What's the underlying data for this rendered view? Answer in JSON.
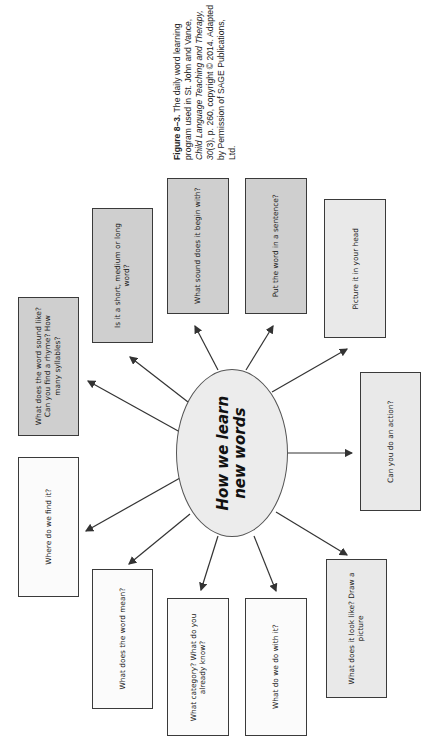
{
  "caption": {
    "figure_label": "Figure 8–3.",
    "text_1": " The daily word learning program used in St. John and Vance, ",
    "journal": "Child Language Teaching and Therapy, 30",
    "text_2": "(3), p. 260, copyright © 2014. Adapted by Permission of SAGE Publications, Ltd."
  },
  "center": {
    "line1": "How we learn",
    "line2": "new words"
  },
  "boxes": [
    {
      "id": "sound-like",
      "text": "What does the word sound like? Can you find a rhyme? How many syllables?",
      "fill": "dark",
      "x": 18,
      "y": 297,
      "w": 61,
      "h": 139
    },
    {
      "id": "word-length",
      "text": "Is it a short, medium or long word?",
      "fill": "dark",
      "x": 92,
      "y": 208,
      "w": 61,
      "h": 135
    },
    {
      "id": "begin-sound",
      "text": "What sound does it begin with?",
      "fill": "dark",
      "x": 167,
      "y": 178,
      "w": 62,
      "h": 136
    },
    {
      "id": "in-sentence",
      "text": "Put the word in a sentence?",
      "fill": "dark",
      "x": 245,
      "y": 178,
      "w": 62,
      "h": 136
    },
    {
      "id": "picture-it",
      "text": "Picture it in your head",
      "fill": "light",
      "x": 324,
      "y": 199,
      "w": 62,
      "h": 139
    },
    {
      "id": "action",
      "text": "Can you do an action?",
      "fill": "light",
      "x": 360,
      "y": 372,
      "w": 61,
      "h": 139
    },
    {
      "id": "look-like",
      "text": "What does it look like? Draw a picture",
      "fill": "light",
      "x": 326,
      "y": 559,
      "w": 61,
      "h": 139
    },
    {
      "id": "do-with-it",
      "text": "What do we do with it?",
      "fill": "white",
      "x": 245,
      "y": 598,
      "w": 62,
      "h": 138
    },
    {
      "id": "category",
      "text": "What category? What do you already know?",
      "fill": "white",
      "x": 167,
      "y": 598,
      "w": 62,
      "h": 138
    },
    {
      "id": "meaning",
      "text": "What does the word mean?",
      "fill": "white",
      "x": 92,
      "y": 569,
      "w": 61,
      "h": 140
    },
    {
      "id": "find-it",
      "text": "Where do we find it?",
      "fill": "white",
      "x": 18,
      "y": 457,
      "w": 61,
      "h": 140
    }
  ],
  "colors": {
    "dark_fill": "#cfcfcf",
    "light_fill": "#e9e9e9",
    "white_fill": "#fbfbfb",
    "stroke": "#3a3a3a"
  }
}
